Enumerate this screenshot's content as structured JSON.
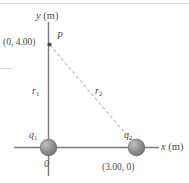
{
  "figure": {
    "background_color": "#ffffff",
    "axis_color": "#808080",
    "dashed_line_color": "#9a9a9a",
    "sphere_color": "#8c8c8c",
    "text_color": "#4a4a4a"
  },
  "axes": {
    "y_label": "y",
    "y_unit": "(m)",
    "x_label": "x",
    "x_unit": "(m)",
    "origin_label": "0"
  },
  "points": {
    "p": {
      "name": "P",
      "coordinate_label": "(0, 4.00)",
      "x_value": 0,
      "y_value": 4.0
    },
    "q1": {
      "name": "q",
      "subscript": "1",
      "coordinate_label": "0",
      "x_value": 0,
      "y_value": 0
    },
    "q2": {
      "name": "q",
      "subscript": "2",
      "coordinate_label": "(3.00, 0)",
      "x_value": 3.0,
      "y_value": 0
    }
  },
  "distances": {
    "r1": {
      "name": "r",
      "subscript": "1"
    },
    "r2": {
      "name": "r",
      "subscript": "2"
    }
  }
}
